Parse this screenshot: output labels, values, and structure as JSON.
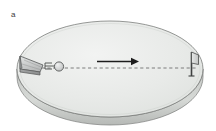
{
  "figure": {
    "panel_label": "a",
    "caption_text": "",
    "background_color": "#ffffff"
  },
  "scene": {
    "disc": {
      "name": "rotating-disc",
      "top_face_fill": "#e9ebe9",
      "top_face_stroke": "#7d7f7d",
      "rim_fill": "#cfd2cf",
      "rim_stroke": "#7d7f7d",
      "center_x": 110,
      "center_y": 69,
      "radius_x": 93,
      "radius_y": 48,
      "thickness": 8
    },
    "launcher": {
      "name": "launcher-wedge",
      "label": "",
      "fill_light": "#cfd1d0",
      "fill_dark": "#9a9c9b",
      "stroke": "#555757"
    },
    "projectile": {
      "name": "projectile-ball",
      "label": "",
      "fill": "#d5d7d6",
      "stroke": "#555757"
    },
    "spring_marks": {
      "name": "spring-marks",
      "stroke": "#4a4c4b"
    },
    "motion_arrow": {
      "name": "motion-arrow",
      "label": "",
      "color": "#1c1c1c",
      "direction": "right"
    },
    "trajectory_line": {
      "name": "trajectory-dashed-line",
      "color": "#6f7170",
      "style": "dashed"
    },
    "target": {
      "name": "target-plate",
      "label": "",
      "fill": "#d8dad9",
      "stroke": "#4a4c4b"
    }
  }
}
